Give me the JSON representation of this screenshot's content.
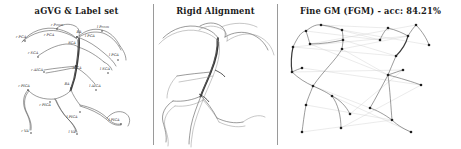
{
  "figure": {
    "width": 461,
    "height": 149,
    "background": "#ffffff",
    "ink_color": "#3a3a3a",
    "node_color": "#2b2b2b",
    "match_line_color": "#c9c9c9",
    "divider_color": "#9a9a9a"
  },
  "panels": [
    {
      "id": "agvg-label-set",
      "title": "aGVG & Label set",
      "description": "Annotated cerebral vascular graph with anatomical vessel label set"
    },
    {
      "id": "rigid-alignment",
      "title": "Rigid Alignment",
      "description": "Two vascular graphs overlaid after rigid alignment"
    },
    {
      "id": "fine-gm",
      "title": "Fine GM (FGM) - acc: 84.21%",
      "method": "Fine GM (FGM)",
      "accuracy_label": "acc",
      "accuracy_value": "84.21%",
      "description": "Side-by-side graphs with node correspondence lines"
    }
  ],
  "vessel_labels": [
    {
      "text": "r Pcom",
      "x": 57,
      "y": 25
    },
    {
      "text": "l Pcom",
      "x": 103,
      "y": 27
    },
    {
      "text": "BA",
      "x": 79,
      "y": 32
    },
    {
      "text": "r PCA",
      "x": 49,
      "y": 35
    },
    {
      "text": "l PCA",
      "x": 90,
      "y": 36
    },
    {
      "text": "r PCA",
      "x": 21,
      "y": 37
    },
    {
      "text": "SCA",
      "x": 72,
      "y": 43
    },
    {
      "text": "r SCA",
      "x": 33,
      "y": 53
    },
    {
      "text": "l PCA",
      "x": 114,
      "y": 55
    },
    {
      "text": "AICA",
      "x": 77,
      "y": 68
    },
    {
      "text": "r AICA",
      "x": 37,
      "y": 70
    },
    {
      "text": "l SCA",
      "x": 105,
      "y": 69
    },
    {
      "text": "BA",
      "x": 67,
      "y": 84
    },
    {
      "text": "r PICA",
      "x": 24,
      "y": 86
    },
    {
      "text": "l AICA",
      "x": 95,
      "y": 86
    },
    {
      "text": "r PICA",
      "x": 45,
      "y": 105
    },
    {
      "text": "l PICA",
      "x": 72,
      "y": 117
    },
    {
      "text": "l PICA",
      "x": 114,
      "y": 120
    },
    {
      "text": "r VA",
      "x": 25,
      "y": 131
    },
    {
      "text": "l VA",
      "x": 72,
      "y": 132
    }
  ],
  "graph_nodes": {
    "panel_3_left": [
      [
        26,
        31
      ],
      [
        41,
        25
      ],
      [
        13,
        47
      ],
      [
        30,
        44
      ],
      [
        62,
        30
      ],
      [
        63,
        40
      ],
      [
        62,
        49
      ],
      [
        12,
        72
      ],
      [
        22,
        68
      ],
      [
        33,
        86
      ],
      [
        26,
        105
      ],
      [
        52,
        96
      ],
      [
        22,
        132
      ],
      [
        61,
        128
      ],
      [
        70,
        114
      ]
    ],
    "panel_3_right": [
      [
        100,
        40
      ],
      [
        108,
        28
      ],
      [
        128,
        36
      ],
      [
        136,
        25
      ],
      [
        149,
        45
      ],
      [
        116,
        56
      ],
      [
        108,
        75
      ],
      [
        123,
        70
      ],
      [
        141,
        85
      ],
      [
        90,
        108
      ],
      [
        112,
        120
      ],
      [
        131,
        132
      ]
    ]
  }
}
